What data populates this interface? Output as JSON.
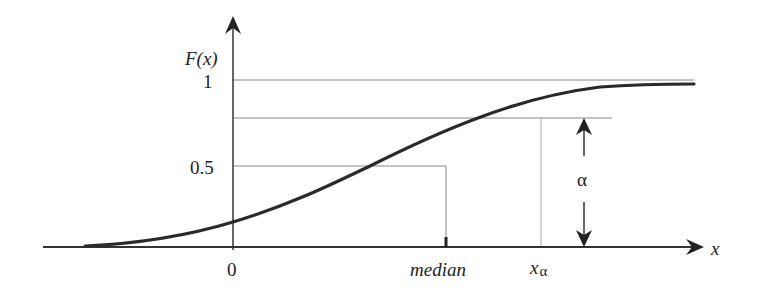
{
  "figure": {
    "type": "cumulative-distribution-diagram"
  },
  "axes": {
    "y_label": "F(x)",
    "x_label": "x",
    "y_ticks": [
      {
        "label": "1",
        "value": 1.0
      },
      {
        "label": "0.5",
        "value": 0.5
      }
    ],
    "x_ticks": [
      {
        "label": "0",
        "position": "origin"
      }
    ]
  },
  "annotations": {
    "median_label": "median",
    "x_alpha_label": "x",
    "x_alpha_subscript": "α",
    "alpha_label": "α",
    "alpha_level_value": 0.8
  },
  "colors": {
    "curve": "#2a2a2a",
    "axis": "#333333",
    "guide_lines": "#888888",
    "background": "#ffffff"
  }
}
